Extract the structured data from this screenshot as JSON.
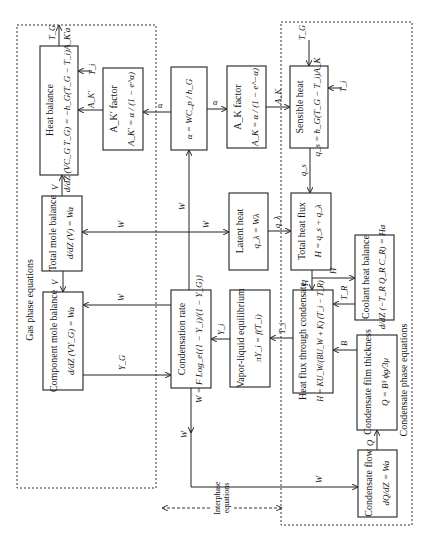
{
  "figure": {
    "orientation": "rotated-90-ccw",
    "sections": {
      "gas_phase": "Gas phase equations",
      "condensate_phase": "Condensate phase equations",
      "interphase_line1": "Interphase",
      "interphase_line2": "equations"
    },
    "boxes": {
      "heat_balance": {
        "title": "Heat balance",
        "equation": "d/dZ (VC_G T_G) = −h_G(T_G − T_i)A_K′a"
      },
      "ak_prime_factor": {
        "title": "A_K′ factor",
        "equation": "A_K′ = α / (1 − e^α)"
      },
      "alpha": {
        "title": "",
        "equation": "α = WC_p / h_G"
      },
      "ak_factor": {
        "title": "A_K factor",
        "equation": "A_K = α / (1 − e^−α)"
      },
      "sensible_heat": {
        "title": "Sensible heat",
        "equation": "q_s = h_G(T_G − T_i)A_K"
      },
      "total_mole_balance": {
        "title": "Total mole balance",
        "equation": "d/dZ (V) = Wa"
      },
      "latent_heat": {
        "title": "Latent heat",
        "equation": "q_λ = Wλ"
      },
      "total_heat_flux": {
        "title": "Total heat flux",
        "equation": "H = q_s + q_λ"
      },
      "component_mole_balance": {
        "title": "Component mole balance",
        "equation": "d/dZ (VY_G) = Wa"
      },
      "condensation_rate": {
        "title": "Condensation rate",
        "equation": "W = F Log_e{(1 − Y_i)/(1 − Y_G)}"
      },
      "vapor_liquid_equilibrium": {
        "title": "Vapor-liquid equilibrium",
        "equation": "πY_i = f(T_i)"
      },
      "heat_flux_condensate": {
        "title": "Heat flux through condensate",
        "equation": "H = KU_W/(BU_W + K) (T_i − T_R)"
      },
      "coolant_heat_balance": {
        "title": "Coolant heat balance",
        "equation": "d/dZ (−T_R Q_R C_R) = Ha"
      },
      "condensate_film_thickness": {
        "title": "Condensate film thickness",
        "equation": "Q = B³ ϕg/3μ"
      },
      "condensate_flow": {
        "title": "Condensate flow",
        "equation": "dQ/dZ = Wa"
      }
    },
    "signals": {
      "TG": "T_G",
      "Ti": "T_i",
      "AKp": "A_K′",
      "AK": "A_K",
      "alpha": "α",
      "V": "V",
      "W": "W",
      "qs": "q_s",
      "ql": "q_λ",
      "H": "H",
      "TR": "T_R",
      "B": "B",
      "Q": "Q",
      "Yi": "Y_i",
      "YG": "Y_G"
    }
  }
}
